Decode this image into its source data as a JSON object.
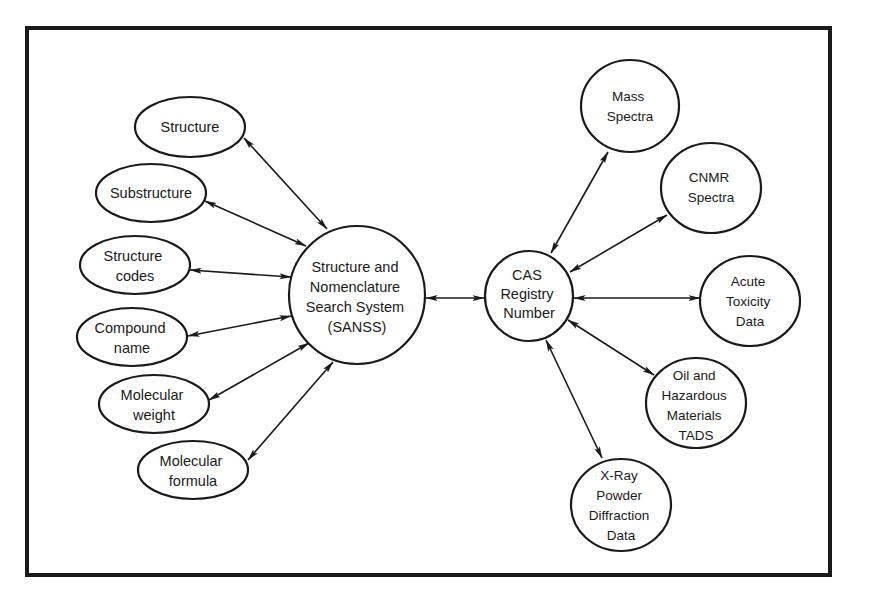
{
  "diagram": {
    "type": "hub-and-spoke relationship diagram",
    "colors": {
      "ink": "#1a1a1a",
      "background": "#ffffff"
    },
    "hubs": {
      "sanss": {
        "lines": [
          "Structure and",
          "Nomenclature",
          "Search System",
          "(SANSS)"
        ]
      },
      "cas": {
        "lines": [
          "CAS",
          "Registry",
          "Number"
        ]
      }
    },
    "left_nodes": [
      {
        "id": "structure",
        "lines": [
          "Structure"
        ]
      },
      {
        "id": "substructure",
        "lines": [
          "Substructure"
        ]
      },
      {
        "id": "structure-codes",
        "lines": [
          "Structure",
          "codes"
        ]
      },
      {
        "id": "compound-name",
        "lines": [
          "Compound",
          "name"
        ]
      },
      {
        "id": "molecular-weight",
        "lines": [
          "Molecular",
          "weight"
        ]
      },
      {
        "id": "molecular-formula",
        "lines": [
          "Molecular",
          "formula"
        ]
      }
    ],
    "right_nodes": [
      {
        "id": "mass-spectra",
        "lines": [
          "Mass",
          "Spectra"
        ]
      },
      {
        "id": "cnmr-spectra",
        "lines": [
          "CNMR",
          "Spectra"
        ]
      },
      {
        "id": "acute-toxicity",
        "lines": [
          "Acute",
          "Toxicity",
          "Data"
        ]
      },
      {
        "id": "oil-hazardous",
        "lines": [
          "Oil and",
          "Hazardous",
          "Materials",
          "TADS"
        ]
      },
      {
        "id": "xray-powder",
        "lines": [
          "X-Ray",
          "Powder",
          "Diffraction",
          "Data"
        ]
      }
    ],
    "edges": [
      {
        "from": "structure",
        "to": "sanss",
        "bidirectional": true
      },
      {
        "from": "substructure",
        "to": "sanss",
        "bidirectional": true
      },
      {
        "from": "structure-codes",
        "to": "sanss",
        "bidirectional": true
      },
      {
        "from": "compound-name",
        "to": "sanss",
        "bidirectional": true
      },
      {
        "from": "molecular-weight",
        "to": "sanss",
        "bidirectional": true
      },
      {
        "from": "molecular-formula",
        "to": "sanss",
        "bidirectional": true
      },
      {
        "from": "sanss",
        "to": "cas",
        "bidirectional": true
      },
      {
        "from": "cas",
        "to": "mass-spectra",
        "bidirectional": true
      },
      {
        "from": "cas",
        "to": "cnmr-spectra",
        "bidirectional": true
      },
      {
        "from": "cas",
        "to": "acute-toxicity",
        "bidirectional": true
      },
      {
        "from": "cas",
        "to": "oil-hazardous",
        "bidirectional": true
      },
      {
        "from": "cas",
        "to": "xray-powder",
        "bidirectional": true
      }
    ]
  }
}
